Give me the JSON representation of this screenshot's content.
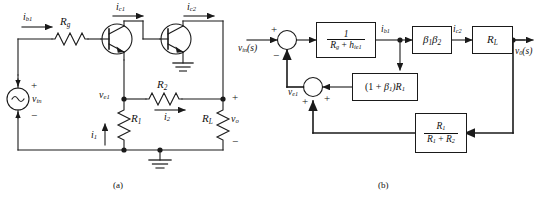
{
  "figure": {
    "caption_a": "(a)",
    "caption_b": "(b)"
  },
  "circuit": {
    "title": "two-stage transistor amplifier circuit",
    "source_label": "v",
    "source_sub": "in",
    "source_plus": "+",
    "source_minus": "−",
    "labels": {
      "ib1": "i",
      "ib1_sub": "b1",
      "ic1": "i",
      "ic1_sub": "c1",
      "ic2": "i",
      "ic2_sub": "c2",
      "rg": "R",
      "rg_sub": "g",
      "r2": "R",
      "r2_sub": "2",
      "r1": "R",
      "r1_sub": "1",
      "rl": "R",
      "rl_sub": "L",
      "ve1": "v",
      "ve1_sub": "e1",
      "i1": "i",
      "i1_sub": "1",
      "i2": "i",
      "i2_sub": "2",
      "vo": "v",
      "vo_sub": "o",
      "vo_plus": "+",
      "vo_minus": "−"
    }
  },
  "block_diagram": {
    "title": "equivalent feedback block diagram",
    "input_label": "v",
    "input_sub": "in",
    "input_arg": "(s)",
    "output_label": "v",
    "output_sub": "0",
    "output_arg": "(s)",
    "node_ve1": "v",
    "node_ve1_sub": "e1",
    "signal_ib1": "i",
    "signal_ib1_sub": "b1",
    "signal_ic2": "i",
    "signal_ic2_sub": "c2",
    "sum1": {
      "name": "input summing junction",
      "sign_top": "+",
      "sign_bottom": "−"
    },
    "sum2": {
      "name": "feedback summing junction",
      "sign_left": "+",
      "sign_right": "+"
    },
    "blocks": [
      {
        "id": "forward-gain",
        "numerator": "1",
        "denominator_r": "R",
        "denominator_r_sub": "g",
        "denominator_plus": " + ",
        "denominator_h": "h",
        "denominator_h_sub": "ie1"
      },
      {
        "id": "beta-product",
        "b1": "β",
        "b1_sub": "1",
        "b2": "β",
        "b2_sub": "2"
      },
      {
        "id": "load-resistance",
        "r": "R",
        "r_sub": "L"
      },
      {
        "id": "emitter-feedback",
        "text_open": "(1 + ",
        "beta": "β",
        "beta_sub": "1",
        "text_close": ")R",
        "r_sub": "1"
      },
      {
        "id": "voltage-divider",
        "num_r": "R",
        "num_r_sub": "1",
        "den_r1": "R",
        "den_r1_sub": "1",
        "den_plus": " + ",
        "den_r2": "R",
        "den_r2_sub": "2"
      }
    ]
  },
  "colors": {
    "line": "#1a1a1a",
    "text": "#111111",
    "background": "#ffffff"
  }
}
